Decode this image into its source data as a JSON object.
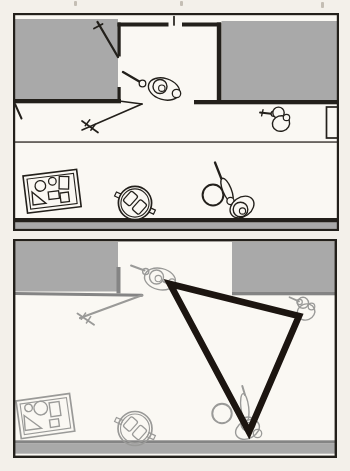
{
  "figure": {
    "colors": {
      "paper_bg": "#f3f0ea",
      "panel_bg": "#faf8f3",
      "wall_gray": "#a9a9a9",
      "edge_gray": "#848484",
      "sketch_gray": "#9a9a98",
      "ink_dark": "#23201b",
      "triangle_ink": "#1c1510"
    },
    "panels": [
      {
        "name": "overview-panel",
        "elements": [
          "gray-wall-area-left",
          "gray-wall-area-right",
          "room-walls",
          "open-door",
          "pole-with-crossbar",
          "door-tick",
          "person-holding-pointer",
          "person-near-right-wall",
          "person-drawing-with-ball",
          "ball",
          "round-stool-with-objects",
          "tray-of-objects",
          "wall-window",
          "corridor-line",
          "baseboard-strip"
        ]
      },
      {
        "name": "closeup-triangle-panel",
        "elements": [
          "gray-wall-area-left",
          "gray-wall-area-right",
          "open-door",
          "pole-with-crossbar",
          "person-at-doorway",
          "person-at-right",
          "person-at-bottom-with-ball",
          "ball",
          "round-stool-with-objects",
          "tray-of-objects",
          "baseboard-strip",
          "triangle-overlay"
        ]
      }
    ],
    "triangle": {
      "points": "157,45 286,77 236,193",
      "stroke_width": 6.6
    }
  }
}
